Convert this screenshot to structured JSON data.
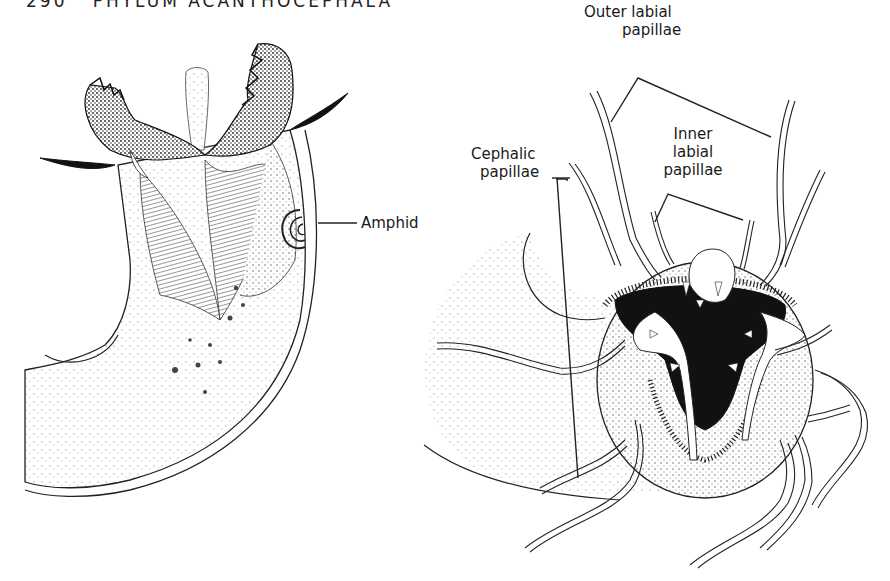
{
  "page": {
    "header": "290   PHYLUM ACANTHOCEPHALA"
  },
  "figure": {
    "left_panel": {
      "description": "Lateral view of anterior end with jaws and amphid",
      "labels": {
        "amphid": "Amphid"
      }
    },
    "right_panel": {
      "description": "En face view of head showing papillae",
      "labels": {
        "outer_labial_line1": "Outer labial",
        "outer_labial_line2": "papillae",
        "inner_labial_line1": "Inner",
        "inner_labial_line2": "labial",
        "inner_labial_line3": "papillae",
        "cephalic_line1": "Cephalic",
        "cephalic_line2": "papillae"
      }
    }
  }
}
